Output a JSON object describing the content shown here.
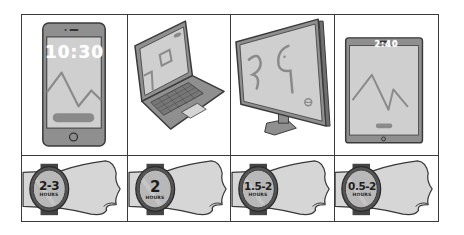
{
  "figure": {
    "colors": {
      "outline": "#3a3a3a",
      "device_body": "#8f8f8f",
      "screen": "#cfcfcf",
      "screen_art": "#8a8a8a",
      "skin": "#d6d6d6",
      "watch_face": "#b8b8b8",
      "background": "#ffffff"
    },
    "devices": [
      {
        "name": "smartphone",
        "icon": "smartphone-icon",
        "screen_time": "10:30"
      },
      {
        "name": "laptop",
        "icon": "laptop-icon"
      },
      {
        "name": "desktop-monitor",
        "icon": "monitor-icon"
      },
      {
        "name": "tablet",
        "icon": "tablet-icon",
        "screen_time": "2:40"
      }
    ],
    "watches": [
      {
        "value": "2-3",
        "unit": "HOURS"
      },
      {
        "value": "2",
        "unit": "HOURS"
      },
      {
        "value": "1.5-2",
        "unit": "HOURS"
      },
      {
        "value": "0.5-2",
        "unit": "HOURS"
      }
    ]
  }
}
